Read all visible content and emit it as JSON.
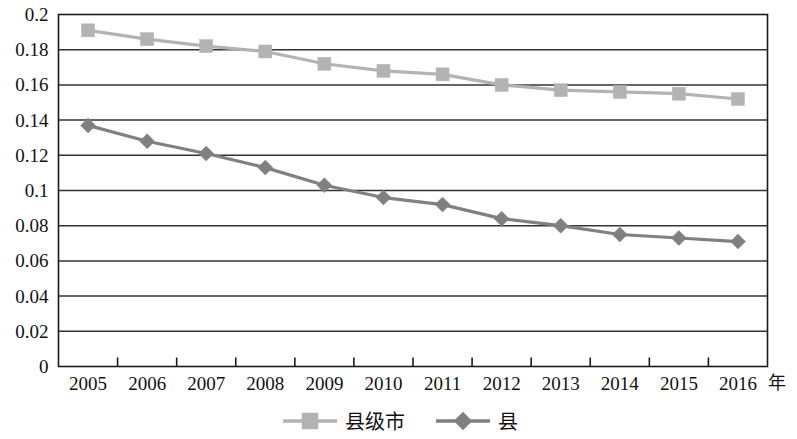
{
  "chart_data": {
    "type": "line",
    "title": "",
    "xlabel": "年",
    "ylabel": "",
    "categories": [
      "2005",
      "2006",
      "2007",
      "2008",
      "2009",
      "2010",
      "2011",
      "2012",
      "2013",
      "2014",
      "2015",
      "2016"
    ],
    "series": [
      {
        "name": "县级市",
        "marker": "square",
        "color": "#b3b3b3",
        "values": [
          0.191,
          0.186,
          0.182,
          0.179,
          0.172,
          0.168,
          0.166,
          0.16,
          0.157,
          0.156,
          0.155,
          0.152
        ]
      },
      {
        "name": "县",
        "marker": "diamond",
        "color": "#808080",
        "values": [
          0.137,
          0.128,
          0.121,
          0.113,
          0.103,
          0.096,
          0.092,
          0.084,
          0.08,
          0.075,
          0.073,
          0.071
        ]
      }
    ],
    "ylim": [
      0,
      0.2
    ],
    "ytick_step": 0.02,
    "ytick_labels": [
      "0",
      "0.02",
      "0.04",
      "0.06",
      "0.08",
      "0.1",
      "0.12",
      "0.14",
      "0.16",
      "0.18",
      "0.2"
    ],
    "grid": "horizontal",
    "legend_position": "bottom"
  },
  "legend": {
    "items": [
      {
        "label": "县级市",
        "marker": "square",
        "color": "#b3b3b3"
      },
      {
        "label": "县",
        "marker": "diamond",
        "color": "#808080"
      }
    ]
  },
  "axis": {
    "x_unit_label": "年"
  },
  "colors": {
    "series_county_city": "#b3b3b3",
    "series_county": "#808080",
    "grid": "#333333",
    "frame": "#1a1a1a",
    "text": "#111111",
    "background": "#ffffff"
  }
}
